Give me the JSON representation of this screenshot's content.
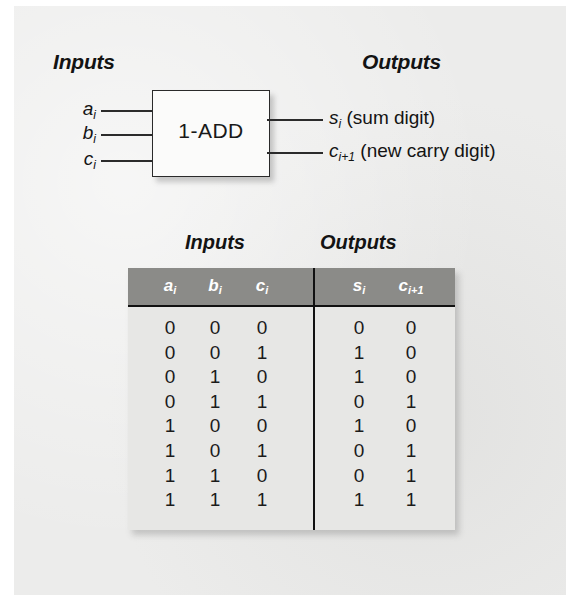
{
  "figure": {
    "diagram": {
      "inputs_heading": "Inputs",
      "outputs_heading": "Outputs",
      "block_label": "1-ADD",
      "input_labels": [
        {
          "name": "a",
          "sub": "i"
        },
        {
          "name": "b",
          "sub": "i"
        },
        {
          "name": "c",
          "sub": "i"
        }
      ],
      "output_labels": [
        {
          "name": "s",
          "sub": "i",
          "desc": "(sum digit)"
        },
        {
          "name": "c",
          "sub": "i+1",
          "desc": "(new carry digit)"
        }
      ]
    },
    "table": {
      "caption_inputs": "Inputs",
      "caption_outputs": "Outputs",
      "input_headers": [
        {
          "name": "a",
          "sub": "i"
        },
        {
          "name": "b",
          "sub": "i"
        },
        {
          "name": "c",
          "sub": "i"
        }
      ],
      "output_headers": [
        {
          "name": "s",
          "sub": "i"
        },
        {
          "name": "c",
          "sub": "i+1"
        }
      ],
      "rows": [
        {
          "a": "0",
          "b": "0",
          "c": "0",
          "s": "0",
          "cout": "0"
        },
        {
          "a": "0",
          "b": "0",
          "c": "1",
          "s": "1",
          "cout": "0"
        },
        {
          "a": "0",
          "b": "1",
          "c": "0",
          "s": "1",
          "cout": "0"
        },
        {
          "a": "0",
          "b": "1",
          "c": "1",
          "s": "0",
          "cout": "1"
        },
        {
          "a": "1",
          "b": "0",
          "c": "0",
          "s": "1",
          "cout": "0"
        },
        {
          "a": "1",
          "b": "0",
          "c": "1",
          "s": "0",
          "cout": "1"
        },
        {
          "a": "1",
          "b": "1",
          "c": "0",
          "s": "0",
          "cout": "1"
        },
        {
          "a": "1",
          "b": "1",
          "c": "1",
          "s": "1",
          "cout": "1"
        }
      ]
    },
    "colors": {
      "page_background": "#ececeb",
      "header_band": "#8b8b88",
      "header_text": "#ffffff",
      "body_text": "#1b1b1b",
      "rule": "#111111",
      "box_fill": "#fbfbfa"
    }
  }
}
